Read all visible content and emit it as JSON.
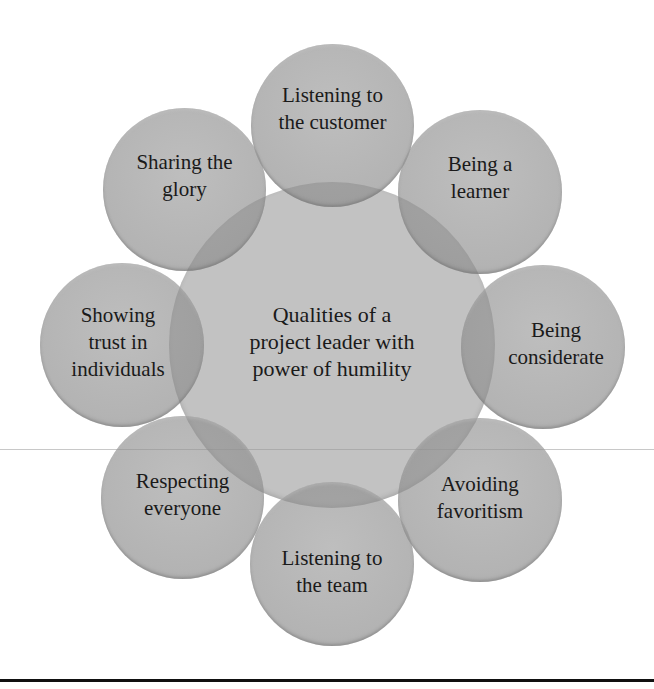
{
  "diagram": {
    "type": "radial-venn",
    "center": {
      "label": "Qualities of a\nproject leader with\npower of humility"
    },
    "satellites": [
      {
        "position": "top",
        "label": "Listening to\nthe customer"
      },
      {
        "position": "top-right",
        "label": "Being a\nlearner"
      },
      {
        "position": "right",
        "label": "Being\nconsiderate"
      },
      {
        "position": "bottom-right",
        "label": "Avoiding\nfavoritism"
      },
      {
        "position": "bottom",
        "label": "Listening to\nthe team"
      },
      {
        "position": "bottom-left",
        "label": "Respecting\neveryone"
      },
      {
        "position": "left",
        "label": "Showing\ntrust in\nindividuals"
      },
      {
        "position": "top-left",
        "label": "Sharing the\nglory"
      }
    ],
    "colors": {
      "circle_fill": "#a5a5a5",
      "overlap_fill": "#8a8a8a",
      "text": "#1a1a1a",
      "rule": "#111111"
    }
  }
}
